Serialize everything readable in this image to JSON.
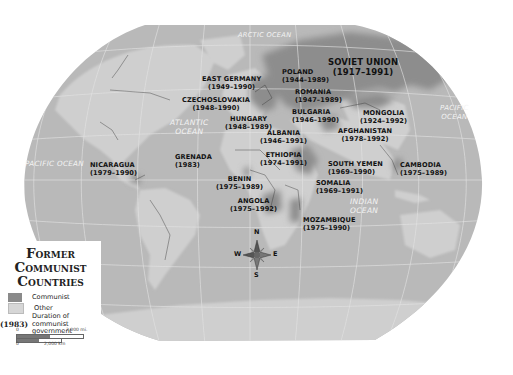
{
  "map": {
    "title_lines": [
      "Former",
      "Communist",
      "Countries"
    ],
    "colors": {
      "communist": "#8a8a8a",
      "other": "#c8c8c8",
      "ocean": "#b4b4b4",
      "background": "#ffffff",
      "text": "#111111"
    },
    "oceans": [
      {
        "name": "ARCTIC OCEAN",
        "lines": [
          "ARCTIC OCEAN"
        ]
      },
      {
        "name": "ATLANTIC OCEAN",
        "lines": [
          "ATLANTIC",
          "OCEAN"
        ]
      },
      {
        "name": "PACIFIC OCEAN (west)",
        "lines": [
          "PACIFIC OCEAN"
        ]
      },
      {
        "name": "PACIFIC OCEAN (east)",
        "lines": [
          "PACIFIC",
          "OCEAN"
        ]
      },
      {
        "name": "INDIAN OCEAN",
        "lines": [
          "INDIAN",
          "OCEAN"
        ]
      }
    ],
    "countries": [
      {
        "name": "SOVIET UNION",
        "years": "(1917–1991)"
      },
      {
        "name": "POLAND",
        "years": "(1944–1989)"
      },
      {
        "name": "EAST GERMANY",
        "years": "(1949–1990)"
      },
      {
        "name": "ROMANIA",
        "years": "(1947–1989)"
      },
      {
        "name": "CZECHOSLOVAKIA",
        "years": "(1948–1990)"
      },
      {
        "name": "BULGARIA",
        "years": "(1946–1990)"
      },
      {
        "name": "MONGOLIA",
        "years": "(1924–1992)"
      },
      {
        "name": "HUNGARY",
        "years": "(1948–1989)"
      },
      {
        "name": "ALBANIA",
        "years": "(1946–1991)"
      },
      {
        "name": "AFGHANISTAN",
        "years": "(1978–1992)"
      },
      {
        "name": "NICARAGUA",
        "years": "(1979–1990)"
      },
      {
        "name": "GRENADA",
        "years": "(1983)"
      },
      {
        "name": "ETHIOPIA",
        "years": "(1974–1991)"
      },
      {
        "name": "SOUTH YEMEN",
        "years": "(1969–1990)"
      },
      {
        "name": "CAMBODIA",
        "years": "(1975–1989)"
      },
      {
        "name": "BENIN",
        "years": "(1975–1989)"
      },
      {
        "name": "SOMALIA",
        "years": "(1969–1991)"
      },
      {
        "name": "ANGOLA",
        "years": "(1975–1992)"
      },
      {
        "name": "MOZAMBIQUE",
        "years": "(1975–1990)"
      }
    ],
    "compass": {
      "n": "N",
      "s": "S",
      "e": "E",
      "w": "W"
    }
  },
  "legend": {
    "items": [
      {
        "label": "Communist",
        "color": "#8a8a8a"
      },
      {
        "label": "Other",
        "color": "#d6d6d6"
      }
    ],
    "duration_sample": "(1983)",
    "duration_label_lines": [
      "Duration of communist",
      "government"
    ],
    "scale": {
      "miles_start": "0",
      "miles_end": "2,000 mi.",
      "km_start": "0",
      "km_end": "2,000 km"
    }
  }
}
